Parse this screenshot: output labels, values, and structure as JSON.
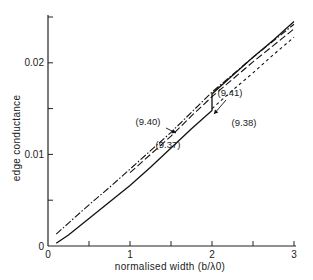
{
  "chart_data": {
    "type": "line",
    "title": "",
    "xlabel": "normalised width (b/λ0)",
    "ylabel": "edge conductance",
    "xlim": [
      0,
      3
    ],
    "ylim": [
      0,
      0.025
    ],
    "x_ticks": [
      0,
      0.5,
      1,
      1.5,
      2,
      2.5,
      3
    ],
    "x_tick_labels": [
      "0",
      "",
      "1",
      "",
      "2",
      "",
      "3"
    ],
    "y_ticks": [
      0,
      0.005,
      0.01,
      0.015,
      0.02,
      0.025
    ],
    "y_tick_labels": [
      "0",
      "",
      "0.01",
      "",
      "0.02",
      ""
    ],
    "grid": false,
    "legend": "none (curves annotated in-plot)",
    "series": [
      {
        "name": "(9.37)",
        "style": "solid",
        "x": [
          0.1,
          0.25,
          0.5,
          0.75,
          1.0,
          1.25,
          1.5,
          1.75,
          2.0,
          2.0,
          2.25,
          2.5,
          2.75,
          3.0
        ],
        "y": [
          0.0003,
          0.0012,
          0.003,
          0.0048,
          0.0066,
          0.0086,
          0.0107,
          0.0128,
          0.0148,
          0.0166,
          0.0186,
          0.0206,
          0.0225,
          0.0245
        ]
      },
      {
        "name": "(9.40)",
        "style": "dash-dot",
        "x": [
          0.1,
          0.25,
          0.5,
          0.75,
          1.0,
          1.25,
          1.5,
          1.75,
          2.0,
          2.25,
          2.5,
          2.75,
          3.0
        ],
        "y": [
          0.0013,
          0.0025,
          0.0045,
          0.0064,
          0.0084,
          0.0104,
          0.0124,
          0.0146,
          0.0168,
          0.0187,
          0.0206,
          0.0224,
          0.0242
        ]
      },
      {
        "name": "(9.41)",
        "style": "long-dash",
        "x": [
          1.0,
          1.25,
          1.5,
          1.75,
          2.0,
          2.25,
          2.5,
          2.75,
          3.0
        ],
        "y": [
          0.008,
          0.01,
          0.012,
          0.0142,
          0.0163,
          0.0182,
          0.0201,
          0.0219,
          0.0237
        ]
      },
      {
        "name": "(9.38)",
        "style": "short-dash",
        "x": [
          2.0,
          2.25,
          2.5,
          2.75,
          3.0
        ],
        "y": [
          0.015,
          0.017,
          0.0189,
          0.0209,
          0.0228
        ]
      }
    ],
    "annotations": [
      {
        "text": "(9.41)",
        "x": 2.1,
        "y": 0.0175,
        "arrow": true
      },
      {
        "text": "(9.38)",
        "x": 2.5,
        "y": 0.0162
      },
      {
        "text": "(9.40)",
        "x": 1.45,
        "y": 0.0134,
        "arrow": true
      },
      {
        "text": "(9.37)",
        "x": 1.9,
        "y": 0.011
      }
    ]
  }
}
